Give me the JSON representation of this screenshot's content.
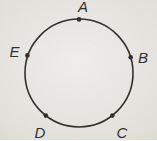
{
  "figure": {
    "paper_color": "#dedcd6",
    "ink_color": "#33302c",
    "circle": {
      "cx": 79,
      "cy": 73,
      "r": 54,
      "stroke_width": 1.6
    },
    "dot_radius": 2.3,
    "points": [
      {
        "label": "A",
        "dot": {
          "x": 79,
          "y": 19.4
        },
        "text": {
          "x": 83,
          "y": 11.5
        }
      },
      {
        "label": "B",
        "dot": {
          "x": 130.7,
          "y": 57.3
        },
        "text": {
          "x": 143,
          "y": 63
        }
      },
      {
        "label": "C",
        "dot": {
          "x": 112.3,
          "y": 115.6
        },
        "text": {
          "x": 122,
          "y": 138
        }
      },
      {
        "label": "D",
        "dot": {
          "x": 45.8,
          "y": 115.6
        },
        "text": {
          "x": 40,
          "y": 137.5
        }
      },
      {
        "label": "E",
        "dot": {
          "x": 27.4,
          "y": 55.4
        },
        "text": {
          "x": 14.5,
          "y": 57
        }
      }
    ]
  }
}
